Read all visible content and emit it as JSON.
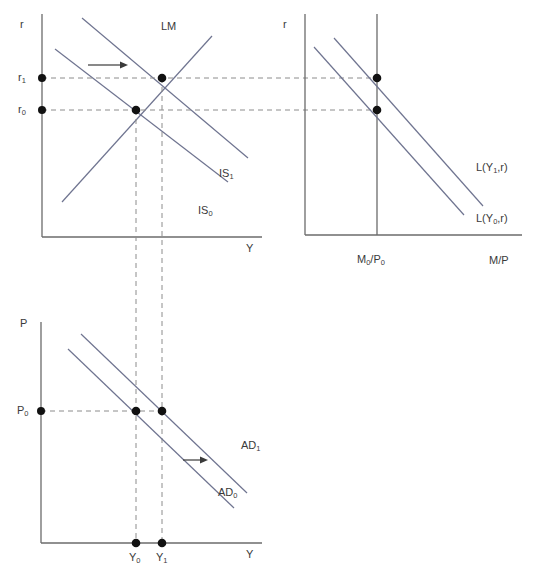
{
  "figure": {
    "caption": ""
  },
  "panels": {
    "islm": {
      "name": "IS-LM diagram",
      "y_axis_label": "r",
      "x_axis_label": "Y",
      "curves": [
        {
          "id": "LM",
          "label": "LM",
          "type": "upward-sloping"
        },
        {
          "id": "IS0",
          "label": "IS",
          "sub": "0",
          "type": "downward-sloping"
        },
        {
          "id": "IS1",
          "label": "IS",
          "sub": "1",
          "type": "downward-sloping"
        }
      ],
      "tick_labels": [
        {
          "id": "r1",
          "label": "r",
          "sub": "1"
        },
        {
          "id": "r0",
          "label": "r",
          "sub": "0"
        }
      ],
      "equilibria": [
        {
          "id": "E0",
          "r": "r0",
          "y": "Y0"
        },
        {
          "id": "E1",
          "r": "r1",
          "y": "Y1"
        }
      ],
      "shift_arrow": "rightward"
    },
    "money": {
      "name": "Money market diagram",
      "y_axis_label": "r",
      "x_axis_label": "M/P",
      "supply_label": "M",
      "supply_sub": "0",
      "supply_label2": "/P",
      "supply_sub2": "0",
      "curves": [
        {
          "id": "LY1r",
          "label": "L(Y",
          "sub": "1",
          "label_end": ",r)"
        },
        {
          "id": "LY0r",
          "label": "L(Y",
          "sub": "0",
          "label_end": ",r)"
        }
      ]
    },
    "ad": {
      "name": "Aggregate demand diagram",
      "y_axis_label": "P",
      "x_axis_label": "Y",
      "price_label": "P",
      "price_sub": "0",
      "curves": [
        {
          "id": "AD0",
          "label": "AD",
          "sub": "0"
        },
        {
          "id": "AD1",
          "label": "AD",
          "sub": "1"
        }
      ],
      "tick_labels": [
        {
          "id": "Y0",
          "label": "Y",
          "sub": "0"
        },
        {
          "id": "Y1",
          "label": "Y",
          "sub": "1"
        }
      ],
      "shift_arrow": "rightward"
    }
  },
  "colors": {
    "curve": "#6f7490",
    "axis": "#6b6b6b",
    "dash": "#8c8c8c",
    "dot": "#111111",
    "text": "#3a3a3a"
  }
}
